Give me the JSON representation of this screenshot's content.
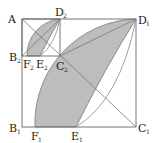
{
  "figure": {
    "shade_color": "#bdbdbd",
    "labels": {
      "A": {
        "main": "A",
        "sub": ""
      },
      "D1": {
        "main": "D",
        "sub": "1"
      },
      "D2": {
        "main": "D",
        "sub": "2"
      },
      "B1": {
        "main": "B",
        "sub": "1"
      },
      "B2": {
        "main": "B",
        "sub": "2"
      },
      "C1": {
        "main": "C",
        "sub": "1"
      },
      "C2": {
        "main": "C",
        "sub": "2"
      },
      "E1": {
        "main": "E",
        "sub": "1"
      },
      "E2": {
        "main": "E",
        "sub": "2"
      },
      "F1": {
        "main": "F",
        "sub": "1"
      },
      "F2": {
        "main": "F",
        "sub": "2"
      }
    }
  }
}
